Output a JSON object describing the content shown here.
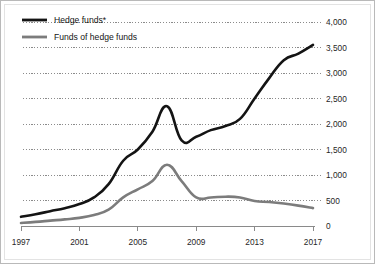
{
  "chart_data": {
    "type": "line",
    "title": "",
    "xlabel": "",
    "ylabel": "",
    "x": [
      1997,
      1998,
      1999,
      2000,
      2001,
      2002,
      2003,
      2004,
      2005,
      2006,
      2007,
      2008,
      2009,
      2010,
      2011,
      2012,
      2013,
      2014,
      2015,
      2016,
      2017
    ],
    "xlim": [
      1997,
      2017
    ],
    "ylim": [
      0,
      4000
    ],
    "grid": true,
    "legend_position": "top-left",
    "xticks": [
      "1997",
      "2001",
      "2005",
      "2009",
      "2013",
      "2017"
    ],
    "xtick_values": [
      1997,
      2001,
      2005,
      2009,
      2013,
      2017
    ],
    "yticks": [
      "0",
      "500",
      "1,000",
      "1,500",
      "2,000",
      "2,500",
      "3,000",
      "3,500",
      "4,000"
    ],
    "ytick_values": [
      0,
      500,
      1000,
      1500,
      2000,
      2500,
      3000,
      3500,
      4000
    ],
    "series": [
      {
        "name": "Hedge funds*",
        "color": "#141414",
        "width": 2.6,
        "values": [
          180,
          230,
          290,
          350,
          430,
          560,
          820,
          1280,
          1500,
          1850,
          2350,
          1680,
          1750,
          1880,
          1960,
          2100,
          2500,
          2900,
          3250,
          3380,
          3550
        ]
      },
      {
        "name": "Funds of hedge funds",
        "color": "#7c7c7c",
        "width": 2.6,
        "values": [
          60,
          80,
          105,
          130,
          160,
          215,
          320,
          560,
          720,
          880,
          1200,
          880,
          560,
          560,
          575,
          560,
          490,
          470,
          440,
          400,
          350
        ]
      }
    ]
  },
  "legend": {
    "items": [
      {
        "label": "Hedge funds*",
        "color": "#141414"
      },
      {
        "label": "Funds of hedge funds",
        "color": "#7c7c7c"
      }
    ]
  }
}
